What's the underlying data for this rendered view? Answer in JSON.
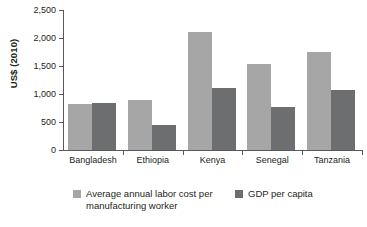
{
  "chart_data": {
    "type": "bar",
    "title": "",
    "subtitle": "",
    "xlabel": "",
    "ylabel": "US$ (2010)",
    "categories": [
      "Bangladesh",
      "Ethiopia",
      "Kenya",
      "Senegal",
      "Tanzania"
    ],
    "series": [
      {
        "name": "Average annual labor cost per manufacturing worker",
        "color": "#a6a6a6",
        "values": [
          830,
          890,
          2110,
          1540,
          1750
        ]
      },
      {
        "name": "GDP per capita",
        "color": "#6d6e70",
        "values": [
          845,
          455,
          1105,
          765,
          1070
        ]
      }
    ],
    "ylim": [
      0,
      2500
    ],
    "ytick_values": [
      0,
      500,
      1000,
      1500,
      2000,
      2500
    ],
    "ytick_labels": [
      "0",
      "500",
      "1,000",
      "1,500",
      "2,000",
      "2,500"
    ],
    "grid": false,
    "legend_position": "bottom",
    "legend_entries": [
      {
        "label_line1": "Average annual labor cost per",
        "label_line2": "manufacturing worker",
        "color": "#a6a6a6"
      },
      {
        "label_line1": "GDP per capita",
        "label_line2": "",
        "color": "#6d6e70"
      }
    ],
    "axis_color": "#58595b",
    "text_color": "#231f20",
    "background": "#ffffff"
  }
}
